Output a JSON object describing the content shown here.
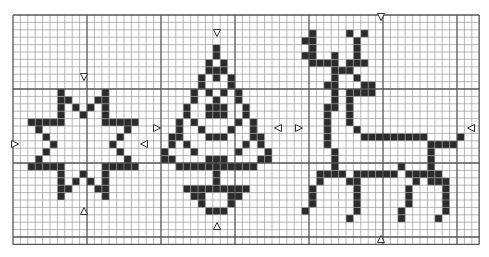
{
  "pattern": {
    "title": "Cross-stitch chart: star, Christmas tree, reindeer",
    "grid": {
      "cols": 63,
      "rows": 31,
      "cell": 7.4,
      "origin_x": 13,
      "origin_y": 15,
      "major_every": 10
    },
    "colors": {
      "stitch": "#2b2b2b",
      "minor_line": "#9a9a9a",
      "major_line": "#555555",
      "background": "#ffffff"
    },
    "motifs": [
      {
        "name": "star",
        "cells": [
          [
            10,
            6
          ],
          [
            10,
            12
          ],
          [
            11,
            6
          ],
          [
            11,
            7
          ],
          [
            11,
            11
          ],
          [
            11,
            12
          ],
          [
            12,
            6
          ],
          [
            12,
            8
          ],
          [
            12,
            10
          ],
          [
            12,
            12
          ],
          [
            13,
            6
          ],
          [
            13,
            9
          ],
          [
            13,
            12
          ],
          [
            14,
            2
          ],
          [
            14,
            3
          ],
          [
            14,
            4
          ],
          [
            14,
            5
          ],
          [
            14,
            6
          ],
          [
            14,
            12
          ],
          [
            14,
            13
          ],
          [
            14,
            14
          ],
          [
            14,
            15
          ],
          [
            14,
            16
          ],
          [
            15,
            3
          ],
          [
            15,
            15
          ],
          [
            16,
            4
          ],
          [
            16,
            14
          ],
          [
            17,
            5
          ],
          [
            17,
            13
          ],
          [
            18,
            4
          ],
          [
            18,
            14
          ],
          [
            19,
            3
          ],
          [
            19,
            15
          ],
          [
            20,
            2
          ],
          [
            20,
            3
          ],
          [
            20,
            4
          ],
          [
            20,
            5
          ],
          [
            20,
            6
          ],
          [
            20,
            12
          ],
          [
            20,
            13
          ],
          [
            20,
            14
          ],
          [
            20,
            15
          ],
          [
            20,
            16
          ],
          [
            21,
            6
          ],
          [
            21,
            9
          ],
          [
            21,
            12
          ],
          [
            22,
            6
          ],
          [
            22,
            8
          ],
          [
            22,
            10
          ],
          [
            22,
            12
          ],
          [
            23,
            6
          ],
          [
            23,
            7
          ],
          [
            23,
            11
          ],
          [
            23,
            12
          ],
          [
            24,
            6
          ],
          [
            24,
            12
          ]
        ]
      },
      {
        "name": "christmas-tree",
        "cells": [
          [
            4,
            27
          ],
          [
            5,
            27
          ],
          [
            6,
            26
          ],
          [
            6,
            28
          ],
          [
            7,
            26
          ],
          [
            7,
            27
          ],
          [
            7,
            28
          ],
          [
            8,
            25
          ],
          [
            8,
            27
          ],
          [
            8,
            29
          ],
          [
            9,
            25
          ],
          [
            9,
            29
          ],
          [
            10,
            24
          ],
          [
            10,
            26
          ],
          [
            10,
            28
          ],
          [
            10,
            30
          ],
          [
            11,
            24
          ],
          [
            11,
            27
          ],
          [
            11,
            30
          ],
          [
            12,
            23
          ],
          [
            12,
            26
          ],
          [
            12,
            27
          ],
          [
            12,
            28
          ],
          [
            12,
            31
          ],
          [
            13,
            23
          ],
          [
            13,
            26
          ],
          [
            13,
            27
          ],
          [
            13,
            28
          ],
          [
            13,
            31
          ],
          [
            14,
            22
          ],
          [
            14,
            24
          ],
          [
            14,
            30
          ],
          [
            14,
            32
          ],
          [
            15,
            22
          ],
          [
            15,
            25
          ],
          [
            15,
            29
          ],
          [
            15,
            32
          ],
          [
            16,
            21
          ],
          [
            16,
            22
          ],
          [
            16,
            26
          ],
          [
            16,
            27
          ],
          [
            16,
            28
          ],
          [
            16,
            32
          ],
          [
            16,
            33
          ],
          [
            17,
            21
          ],
          [
            17,
            23
          ],
          [
            17,
            31
          ],
          [
            17,
            33
          ],
          [
            18,
            20
          ],
          [
            18,
            24
          ],
          [
            18,
            30
          ],
          [
            18,
            34
          ],
          [
            19,
            20
          ],
          [
            19,
            21
          ],
          [
            19,
            26
          ],
          [
            19,
            27
          ],
          [
            19,
            28
          ],
          [
            19,
            33
          ],
          [
            19,
            34
          ],
          [
            20,
            22
          ],
          [
            20,
            23
          ],
          [
            20,
            24
          ],
          [
            20,
            25
          ],
          [
            20,
            26
          ],
          [
            20,
            27
          ],
          [
            20,
            28
          ],
          [
            20,
            29
          ],
          [
            20,
            30
          ],
          [
            20,
            31
          ],
          [
            20,
            32
          ],
          [
            21,
            27
          ],
          [
            22,
            27
          ],
          [
            23,
            23
          ],
          [
            23,
            24
          ],
          [
            23,
            25
          ],
          [
            23,
            26
          ],
          [
            23,
            27
          ],
          [
            23,
            28
          ],
          [
            23,
            29
          ],
          [
            23,
            30
          ],
          [
            23,
            31
          ],
          [
            24,
            24
          ],
          [
            24,
            25
          ],
          [
            24,
            29
          ],
          [
            24,
            30
          ],
          [
            25,
            25
          ],
          [
            25,
            29
          ],
          [
            26,
            26
          ],
          [
            26,
            27
          ],
          [
            26,
            28
          ]
        ]
      },
      {
        "name": "reindeer",
        "cells": [
          [
            2,
            40
          ],
          [
            2,
            45
          ],
          [
            2,
            47
          ],
          [
            3,
            39
          ],
          [
            3,
            40
          ],
          [
            3,
            46
          ],
          [
            4,
            40
          ],
          [
            4,
            46
          ],
          [
            5,
            39
          ],
          [
            5,
            40
          ],
          [
            5,
            43
          ],
          [
            5,
            46
          ],
          [
            6,
            40
          ],
          [
            6,
            41
          ],
          [
            6,
            42
          ],
          [
            6,
            43
          ],
          [
            6,
            45
          ],
          [
            6,
            46
          ],
          [
            6,
            47
          ],
          [
            7,
            43
          ],
          [
            7,
            44
          ],
          [
            7,
            45
          ],
          [
            8,
            43
          ],
          [
            8,
            46
          ],
          [
            9,
            42
          ],
          [
            9,
            43
          ],
          [
            9,
            47
          ],
          [
            9,
            48
          ],
          [
            10,
            43
          ],
          [
            10,
            45
          ],
          [
            10,
            46
          ],
          [
            10,
            47
          ],
          [
            10,
            48
          ],
          [
            11,
            43
          ],
          [
            11,
            45
          ],
          [
            12,
            42
          ],
          [
            12,
            43
          ],
          [
            12,
            45
          ],
          [
            13,
            42
          ],
          [
            13,
            45
          ],
          [
            14,
            42
          ],
          [
            14,
            45
          ],
          [
            15,
            42
          ],
          [
            15,
            46
          ],
          [
            16,
            42
          ],
          [
            16,
            47
          ],
          [
            16,
            48
          ],
          [
            16,
            49
          ],
          [
            16,
            50
          ],
          [
            16,
            51
          ],
          [
            16,
            52
          ],
          [
            16,
            53
          ],
          [
            16,
            54
          ],
          [
            16,
            55
          ],
          [
            16,
            60
          ],
          [
            17,
            42
          ],
          [
            17,
            56
          ],
          [
            17,
            57
          ],
          [
            17,
            58
          ],
          [
            17,
            59
          ],
          [
            18,
            43
          ],
          [
            18,
            56
          ],
          [
            19,
            43
          ],
          [
            19,
            56
          ],
          [
            20,
            43
          ],
          [
            20,
            52
          ],
          [
            20,
            56
          ],
          [
            21,
            41
          ],
          [
            21,
            42
          ],
          [
            21,
            43
          ],
          [
            21,
            44
          ],
          [
            21,
            46
          ],
          [
            21,
            47
          ],
          [
            21,
            48
          ],
          [
            21,
            49
          ],
          [
            21,
            50
          ],
          [
            21,
            51
          ],
          [
            21,
            53
          ],
          [
            21,
            54
          ],
          [
            21,
            55
          ],
          [
            21,
            56
          ],
          [
            21,
            57
          ],
          [
            22,
            41
          ],
          [
            22,
            45
          ],
          [
            22,
            46
          ],
          [
            22,
            54
          ],
          [
            22,
            56
          ],
          [
            22,
            57
          ],
          [
            22,
            58
          ],
          [
            23,
            40
          ],
          [
            23,
            46
          ],
          [
            23,
            53
          ],
          [
            23,
            58
          ],
          [
            24,
            40
          ],
          [
            24,
            46
          ],
          [
            24,
            53
          ],
          [
            24,
            58
          ],
          [
            25,
            40
          ],
          [
            25,
            46
          ],
          [
            25,
            53
          ],
          [
            25,
            58
          ],
          [
            26,
            39
          ],
          [
            26,
            46
          ],
          [
            26,
            52
          ],
          [
            26,
            58
          ],
          [
            27,
            45
          ],
          [
            27,
            52
          ],
          [
            27,
            57
          ]
        ]
      }
    ],
    "center_markers": [
      {
        "name": "star-top-marker",
        "x": 84,
        "y": 77,
        "dir": "down"
      },
      {
        "name": "star-bottom-marker",
        "x": 84,
        "y": 211,
        "dir": "up"
      },
      {
        "name": "star-left-marker",
        "x": 15,
        "y": 144,
        "dir": "right"
      },
      {
        "name": "star-right-marker",
        "x": 144,
        "y": 144,
        "dir": "left"
      },
      {
        "name": "tree-top-marker",
        "x": 217,
        "y": 33,
        "dir": "down"
      },
      {
        "name": "tree-bottom-marker",
        "x": 217,
        "y": 226,
        "dir": "up"
      },
      {
        "name": "tree-left-marker",
        "x": 157,
        "y": 128,
        "dir": "right"
      },
      {
        "name": "tree-right-marker",
        "x": 278,
        "y": 128,
        "dir": "left"
      },
      {
        "name": "deer-top-marker",
        "x": 381,
        "y": 17,
        "dir": "down"
      },
      {
        "name": "deer-bottom-marker",
        "x": 381,
        "y": 239,
        "dir": "up"
      },
      {
        "name": "deer-left-marker",
        "x": 299,
        "y": 128,
        "dir": "right"
      },
      {
        "name": "deer-right-marker",
        "x": 471,
        "y": 128,
        "dir": "left"
      }
    ]
  }
}
